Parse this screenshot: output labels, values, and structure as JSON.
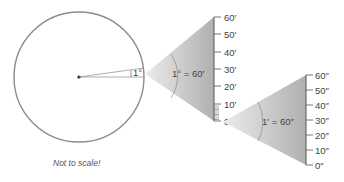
{
  "diagram": {
    "small_angle_label": "1°",
    "cone1_label": "1° = 60′",
    "cone2_label": "1′ = 60″",
    "note": "Not to scale!",
    "scale1": {
      "ticks": [
        "60′",
        "50′",
        "40′",
        "30′",
        "20′",
        "10′",
        "0′"
      ]
    },
    "scale2": {
      "ticks": [
        "60″",
        "50″",
        "40″",
        "30″",
        "20″",
        "10″",
        "0″"
      ]
    },
    "colors": {
      "circle": "#8c8c8c",
      "cone_fill_light": "#e8e8e8",
      "cone_fill_dark": "#b4b4b4",
      "line": "#555555"
    }
  }
}
